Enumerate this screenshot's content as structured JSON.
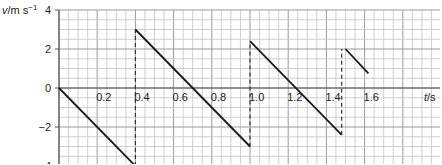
{
  "chart_data": {
    "type": "line",
    "title": "",
    "xlabel": "t/s",
    "ylabel": "v/m s^-1",
    "xlabel_parts": {
      "var": "t",
      "unit": "/s"
    },
    "ylabel_parts": {
      "var": "v",
      "unit": "/m s",
      "exp": "−1"
    },
    "xlim": [
      0,
      2.0
    ],
    "ylim": [
      -4,
      4
    ],
    "grid": true,
    "grid_minor_x": 0.05,
    "grid_minor_y": 0.5,
    "x_ticks": [
      {
        "value": 0.2,
        "label": "0.2"
      },
      {
        "value": 0.4,
        "label": "0.4"
      },
      {
        "value": 0.6,
        "label": "0.6"
      },
      {
        "value": 0.8,
        "label": "0.8"
      },
      {
        "value": 1.0,
        "label": "1.0"
      },
      {
        "value": 1.2,
        "label": "1.2"
      },
      {
        "value": 1.4,
        "label": "1.4"
      },
      {
        "value": 1.6,
        "label": "1.6"
      }
    ],
    "y_ticks": [
      {
        "value": 4,
        "label": "4"
      },
      {
        "value": 2,
        "label": "2"
      },
      {
        "value": 0,
        "label": "0"
      },
      {
        "value": -2,
        "label": "−2"
      },
      {
        "value": -4,
        "label": "−4"
      }
    ],
    "series": [
      {
        "name": "segment-1",
        "style": "solid",
        "points": [
          [
            0,
            0
          ],
          [
            0.4,
            -4
          ]
        ]
      },
      {
        "name": "segment-2",
        "style": "solid",
        "points": [
          [
            0.4,
            3
          ],
          [
            1.0,
            -3
          ]
        ]
      },
      {
        "name": "segment-3",
        "style": "solid",
        "points": [
          [
            1.0,
            2.4
          ],
          [
            1.48,
            -2.4
          ]
        ]
      },
      {
        "name": "segment-4",
        "style": "solid",
        "points": [
          [
            1.5,
            2.0
          ],
          [
            1.62,
            0.75
          ]
        ]
      }
    ],
    "dashed_verticals": [
      {
        "t": 0.4,
        "from": -4,
        "to": 3
      },
      {
        "t": 1.0,
        "from": -3,
        "to": 2.4
      },
      {
        "t": 1.48,
        "from": -2.4,
        "to": 2.0
      }
    ],
    "legend": null
  }
}
